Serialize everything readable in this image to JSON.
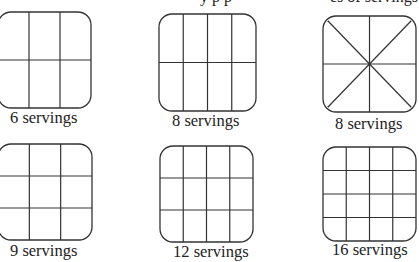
{
  "diagram": {
    "line_color": "#333333",
    "background": "#ffffff",
    "top_clipped_text": [
      {
        "text": "y p p",
        "x": 200
      },
      {
        "text": "es of servings",
        "x": 330
      }
    ],
    "pans": [
      {
        "id": "pan-6-servings",
        "label": "6 servings",
        "servings": 6,
        "cut": "grid",
        "cols": 3,
        "rows": 2,
        "x": -2,
        "y": 12,
        "w": 93,
        "h": 96,
        "label_x": 10,
        "label_y": 123
      },
      {
        "id": "pan-8-servings-grid",
        "label": "8 servings",
        "servings": 8,
        "cut": "grid",
        "cols": 4,
        "rows": 2,
        "x": 159,
        "y": 14,
        "w": 97,
        "h": 97,
        "label_x": 172,
        "label_y": 126
      },
      {
        "id": "pan-8-servings-radial",
        "label": "8 servings",
        "servings": 8,
        "cut": "radial",
        "x": 323,
        "y": 16,
        "w": 93,
        "h": 96,
        "label_x": 335,
        "label_y": 129
      },
      {
        "id": "pan-9-servings",
        "label": "9 servings",
        "servings": 9,
        "cut": "grid",
        "cols": 3,
        "rows": 3,
        "x": -2,
        "y": 144,
        "w": 94,
        "h": 96,
        "label_x": 10,
        "label_y": 256
      },
      {
        "id": "pan-12-servings",
        "label": "12 servings",
        "servings": 12,
        "cut": "grid",
        "cols": 4,
        "rows": 3,
        "x": 160,
        "y": 146,
        "w": 93,
        "h": 96,
        "label_x": 173,
        "label_y": 257
      },
      {
        "id": "pan-16-servings",
        "label": "16 servings",
        "servings": 16,
        "cut": "grid",
        "cols": 4,
        "rows": 4,
        "x": 323,
        "y": 147,
        "w": 93,
        "h": 94,
        "label_x": 332,
        "label_y": 255
      }
    ]
  }
}
